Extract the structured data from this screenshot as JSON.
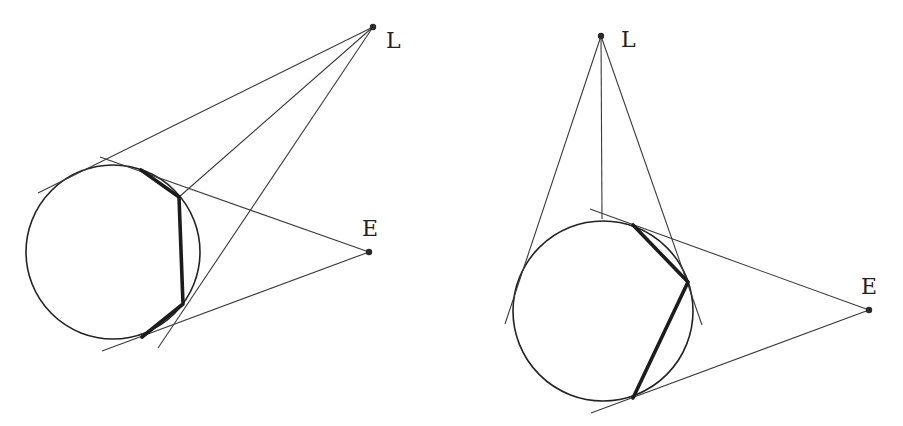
{
  "figures": [
    {
      "id": "left",
      "labels": {
        "light": "L",
        "eye": "E"
      },
      "points": {
        "L": [
          373,
          27
        ],
        "E": [
          369,
          252
        ]
      },
      "label_positions": {
        "L": [
          386,
          48
        ],
        "E": [
          362,
          236
        ]
      },
      "circle": {
        "cx": 113,
        "cy": 252,
        "r": 87
      },
      "polyline": [
        [
          141,
          170
        ],
        [
          179,
          197
        ],
        [
          183,
          304
        ],
        [
          142,
          337
        ]
      ],
      "lines": [
        [
          [
            373,
            27
          ],
          [
            38,
            193
          ]
        ],
        [
          [
            373,
            27
          ],
          [
            179,
            197
          ]
        ],
        [
          [
            373,
            27
          ],
          [
            158,
            348
          ]
        ],
        [
          [
            369,
            252
          ],
          [
            100,
            157
          ]
        ],
        [
          [
            369,
            252
          ],
          [
            102,
            351
          ]
        ]
      ]
    },
    {
      "id": "right",
      "labels": {
        "light": "L",
        "eye": "E"
      },
      "points": {
        "L": [
          601,
          36
        ],
        "E": [
          869,
          310
        ]
      },
      "label_positions": {
        "L": [
          621,
          47
        ],
        "E": [
          861,
          294
        ]
      },
      "circle": {
        "cx": 603,
        "cy": 311,
        "r": 90
      },
      "polyline": [
        [
          633,
          225
        ],
        [
          688,
          282
        ],
        [
          633,
          398
        ]
      ],
      "lines": [
        [
          [
            601,
            36
          ],
          [
            505,
            324
          ]
        ],
        [
          [
            601,
            36
          ],
          [
            602,
            219
          ]
        ],
        [
          [
            601,
            36
          ],
          [
            702,
            325
          ]
        ],
        [
          [
            869,
            310
          ],
          [
            590,
            209
          ]
        ],
        [
          [
            869,
            310
          ],
          [
            591,
            413
          ]
        ]
      ]
    }
  ]
}
